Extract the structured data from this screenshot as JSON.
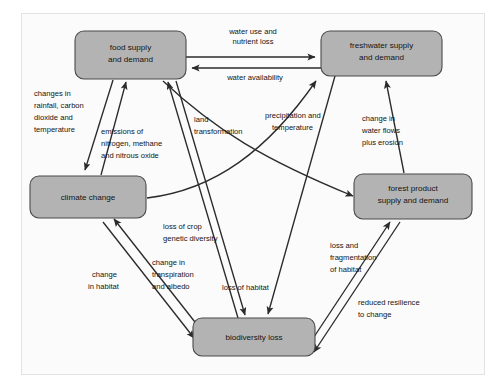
{
  "diagram": {
    "nodes": [
      {
        "id": "food",
        "label_line1": "food supply",
        "label_line2": "and demand"
      },
      {
        "id": "freshwater",
        "label_line1": "freshwater supply",
        "label_line2": "and demand"
      },
      {
        "id": "climate",
        "label_line1": "climate change",
        "label_line2": ""
      },
      {
        "id": "forest",
        "label_line1": "forest product",
        "label_line2": "supply and demand"
      },
      {
        "id": "biodiversity",
        "label_line1": "biodiversity loss",
        "label_line2": ""
      }
    ],
    "edges": [
      {
        "id": "food-to-freshwater",
        "from": "food",
        "to": "freshwater",
        "label_line1": "water use and",
        "label_line2": "nutrient loss",
        "label_line3": ""
      },
      {
        "id": "freshwater-to-food",
        "from": "freshwater",
        "to": "food",
        "label_line1": "water availability",
        "label_line2": "",
        "label_line3": ""
      },
      {
        "id": "food-to-climate",
        "from": "food",
        "to": "climate",
        "label_line1": "changes in",
        "label_line2": "rainfall, carbon",
        "label_line3": "dioxide and",
        "label_line4": "temperature"
      },
      {
        "id": "climate-to-food",
        "from": "climate",
        "to": "food",
        "label_line1": "emissions of",
        "label_line2": "nitrogen, methane",
        "label_line3": "and nitrous oxide"
      },
      {
        "id": "food-to-forest",
        "from": "food",
        "to": "forest",
        "label_line1": "land",
        "label_line2": "transformation",
        "label_line3": ""
      },
      {
        "id": "climate-to-freshwater",
        "from": "climate",
        "to": "freshwater",
        "label_line1": "precipitation and",
        "label_line2": "temperature",
        "label_line3": ""
      },
      {
        "id": "forest-to-freshwater",
        "from": "forest",
        "to": "freshwater",
        "label_line1": "change in",
        "label_line2": "water flows",
        "label_line3": "plus erosion"
      },
      {
        "id": "biodiversity-to-food",
        "from": "biodiversity",
        "to": "food",
        "label_line1": "loss of crop",
        "label_line2": "genetic diversity",
        "label_line3": ""
      },
      {
        "id": "climate-to-biodiversity",
        "from": "climate",
        "to": "biodiversity",
        "label_line1": "change",
        "label_line2": "in habitat",
        "label_line3": ""
      },
      {
        "id": "biodiversity-to-climate",
        "from": "biodiversity",
        "to": "climate",
        "label_line1": "change in",
        "label_line2": "transpiration",
        "label_line3": "and albedo"
      },
      {
        "id": "food-to-biodiversity",
        "from": "food",
        "to": "biodiversity",
        "label_line1": "loss of habitat",
        "label_line2": "",
        "label_line3": ""
      },
      {
        "id": "forest-to-biodiversity",
        "from": "forest",
        "to": "biodiversity",
        "label_line1": "loss and",
        "label_line2": "fragmentation",
        "label_line3": "of habitat"
      },
      {
        "id": "biodiversity-to-forest",
        "from": "biodiversity",
        "to": "forest",
        "label_line1": "reduced resilience",
        "label_line2": "to change",
        "label_line3": ""
      }
    ],
    "colors": {
      "node_fill": "#b3b3b3",
      "node_stroke": "#4a4a4a",
      "edge_stroke": "#2b2b2b",
      "panel_bg": "#fbfbfb",
      "panel_border": "#e2e2e2",
      "text": "#141414"
    }
  }
}
